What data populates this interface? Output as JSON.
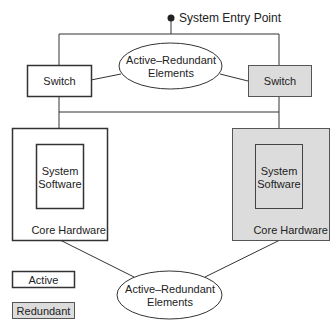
{
  "entry_point": {
    "label": "System Entry Point"
  },
  "top_ellipse": {
    "line1": "Active–Redundant",
    "line2": "Elements"
  },
  "bottom_ellipse": {
    "line1": "Active–Redundant",
    "line2": "Elements"
  },
  "left_switch": {
    "label": "Switch"
  },
  "right_switch": {
    "label": "Switch"
  },
  "left_core": {
    "software_line1": "System",
    "software_line2": "Software",
    "hardware_label": "Core Hardware"
  },
  "right_core": {
    "software_line1": "System",
    "software_line2": "Software",
    "hardware_label": "Core Hardware"
  },
  "legend": {
    "active": "Active",
    "redundant": "Redundant"
  },
  "colors": {
    "active_fill": "#ffffff",
    "redundant_fill": "#dcdcdc",
    "stroke": "#333333"
  }
}
